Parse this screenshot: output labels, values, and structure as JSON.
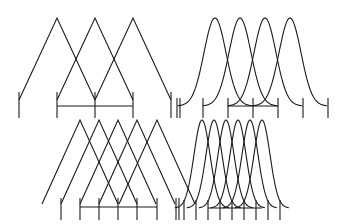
{
  "figure": {
    "stroke_color": "#1a1a1a",
    "background": "#ffffff"
  },
  "panels": [
    {
      "id": "top-left",
      "shape": "triangle",
      "count": 3,
      "peaks_x": [
        57,
        95,
        133
      ],
      "peak_y": 18,
      "base_y": 100,
      "half_width": 38,
      "ticks_x": [
        19,
        57,
        95,
        133,
        171
      ],
      "tick_top": 92,
      "tick_bottom": 118,
      "bar": {
        "x1": 57,
        "x2": 133,
        "y": 106
      }
    },
    {
      "id": "top-right",
      "shape": "gaussian",
      "count": 4,
      "peaks_x": [
        215,
        240,
        265,
        290
      ],
      "peak_y": 18,
      "base_y": 106,
      "sigma": 11,
      "ticks_x": [
        177,
        180,
        203,
        228,
        253,
        278,
        303,
        328
      ],
      "tick_top": 98,
      "tick_bottom": 118,
      "bar": {
        "x1": 228,
        "x2": 278,
        "y": 106
      }
    },
    {
      "id": "bottom-left",
      "shape": "triangle",
      "count": 5,
      "peaks_x": [
        80,
        99,
        118,
        137,
        157
      ],
      "peak_y": 120,
      "base_y": 204,
      "half_width": 38,
      "ticks_x": [
        61,
        80,
        99,
        118,
        137,
        157,
        176,
        179
      ],
      "tick_top": 198,
      "tick_bottom": 220,
      "bar": {
        "x1": 80,
        "x2": 157,
        "y": 207
      }
    },
    {
      "id": "bottom-right",
      "shape": "gaussian",
      "count": 6,
      "peaks_x": [
        202,
        214,
        226,
        238,
        250,
        262
      ],
      "peak_y": 120,
      "base_y": 208,
      "sigma": 8,
      "ticks_x": [
        184,
        196,
        208,
        220,
        232,
        244,
        256,
        268,
        280
      ],
      "tick_top": 200,
      "tick_bottom": 220,
      "bar": {
        "x1": 208,
        "x2": 262,
        "y": 208
      }
    }
  ]
}
